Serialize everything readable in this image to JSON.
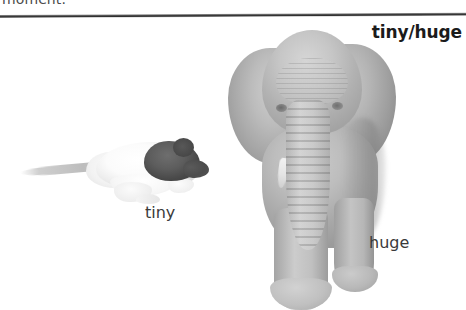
{
  "page": {
    "background_color": "#ffffff",
    "running_text": "moment.",
    "rule_color": "#2f2f2f"
  },
  "section": {
    "heading": "tiny/huge"
  },
  "figure": {
    "items": [
      {
        "subject": "rat",
        "caption": "tiny",
        "description": "hooded white laboratory rat in profile facing right with long tail"
      },
      {
        "subject": "elephant",
        "caption": "huge",
        "description": "grayscale african elephant facing forward with ears spread and trunk hanging down"
      }
    ]
  }
}
